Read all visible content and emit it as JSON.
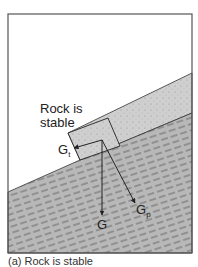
{
  "diagram": {
    "label_rock": "Rock is\nstable",
    "label_rock_line1": "Rock is",
    "label_rock_line2": "stable",
    "forces": {
      "g": {
        "symbol": "G",
        "sub": ""
      },
      "gt": {
        "symbol": "G",
        "sub": "t"
      },
      "gp": {
        "symbol": "G",
        "sub": "p"
      }
    },
    "caption": "(a) Rock is stable",
    "colors": {
      "frame": "#555555",
      "debris": "#c8c8c8",
      "bedrock": "#b4b4b4",
      "line": "#222222",
      "background": "#ffffff"
    }
  }
}
